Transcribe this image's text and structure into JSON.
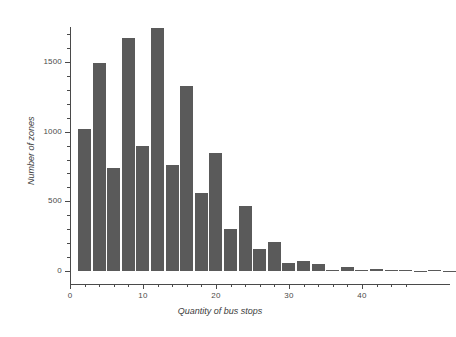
{
  "chart_data": {
    "type": "bar",
    "title": "",
    "subtitle": "",
    "xlabel": "Quantity of bus stops",
    "ylabel": "Number of zones",
    "xlim": [
      0,
      48
    ],
    "ylim": [
      0,
      1800
    ],
    "grid": false,
    "legend": null,
    "bin_width": 2,
    "bar_color": "#5a5a5a",
    "axis_color": "#4a4a4a",
    "x_ticks_major": [
      0,
      10,
      20,
      30,
      40
    ],
    "x_ticks_minor": [
      2,
      4,
      6,
      8,
      12,
      14,
      16,
      18,
      22,
      24,
      26,
      28,
      32,
      34,
      36,
      38,
      42,
      44,
      46
    ],
    "x_tick_labels": [
      "0",
      "10",
      "20",
      "30",
      "40"
    ],
    "y_ticks_major": [
      0,
      500,
      1000,
      1500
    ],
    "y_ticks_minor": [
      100,
      200,
      300,
      400,
      600,
      700,
      800,
      900,
      1100,
      1200,
      1300,
      1400,
      1600,
      1700
    ],
    "y_tick_labels": [
      "0",
      "500",
      "1000",
      "1500"
    ],
    "categories": [
      "1-3",
      "3-5",
      "5-7",
      "7-9",
      "9-11",
      "11-13",
      "13-15",
      "15-17",
      "17-19",
      "19-21",
      "21-23",
      "23-25",
      "25-27",
      "27-29",
      "29-31",
      "31-33",
      "33-35",
      "35-37",
      "37-39",
      "39-41",
      "41-43",
      "43-45",
      "45-47",
      "47-49",
      "49-51",
      "51-53"
    ],
    "x": [
      1,
      3,
      5,
      7,
      9,
      11,
      13,
      15,
      17,
      19,
      21,
      23,
      25,
      27,
      29,
      31,
      33,
      35,
      37,
      39,
      41,
      43,
      45,
      47,
      49,
      51
    ],
    "values": [
      1020,
      1490,
      740,
      1675,
      895,
      1745,
      760,
      1330,
      560,
      845,
      305,
      465,
      155,
      205,
      60,
      75,
      50,
      10,
      30,
      10,
      12,
      5,
      6,
      2,
      8,
      2
    ]
  }
}
